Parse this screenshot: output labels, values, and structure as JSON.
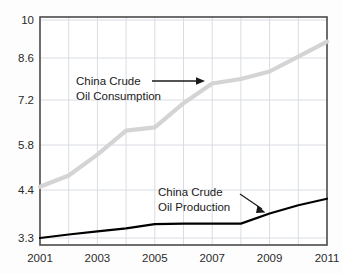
{
  "chart_data": {
    "type": "line",
    "title": "",
    "subtitle": "",
    "xlabel": "",
    "ylabel": "",
    "xlim": [
      2001,
      2011
    ],
    "ylim": [
      3.3,
      10
    ],
    "grid": true,
    "legend_position": "none",
    "x": [
      2001,
      2002,
      2003,
      2004,
      2005,
      2006,
      2007,
      2008,
      2009,
      2010,
      2011
    ],
    "series": [
      {
        "name": "China Crude Oil Consumption",
        "color": "#d4d4d4",
        "values": [
          4.5,
          4.85,
          5.5,
          6.25,
          6.35,
          7.1,
          7.75,
          7.9,
          8.15,
          8.65,
          9.2
        ]
      },
      {
        "name": "China Crude Oil Production",
        "color": "#000000",
        "values": [
          3.3,
          3.38,
          3.45,
          3.52,
          3.62,
          3.63,
          3.63,
          3.63,
          3.86,
          4.05,
          4.2
        ]
      }
    ],
    "y_ticks": [
      {
        "label": "10",
        "value": 10
      },
      {
        "label": "8.6",
        "value": 8.6
      },
      {
        "label": "7.2",
        "value": 7.2
      },
      {
        "label": "5.8",
        "value": 5.8
      },
      {
        "label": "4.4",
        "value": 4.4
      },
      {
        "label": "3.3",
        "value": 3.3
      }
    ],
    "x_ticks": [
      {
        "label": "2001",
        "value": 2001
      },
      {
        "label": "2003",
        "value": 2003
      },
      {
        "label": "2005",
        "value": 2005
      },
      {
        "label": "2007",
        "value": 2007
      },
      {
        "label": "2009",
        "value": 2009
      },
      {
        "label": "2011",
        "value": 2011
      }
    ],
    "x_gridlines": [
      2001,
      2002,
      2003,
      2004,
      2005,
      2006,
      2007,
      2008,
      2009,
      2010,
      2011
    ],
    "annotations": [
      {
        "id": "consumption",
        "line1": "China Crude",
        "line2": "Oil Consumption",
        "arrow": "right"
      },
      {
        "id": "production",
        "line1": "China Crude",
        "line2": "Oil Production",
        "arrow": "down-right"
      }
    ]
  },
  "colors": {
    "consumption_line": "#d4d4d4",
    "production_line": "#000000",
    "gridline": "#d8dce3",
    "axis_frame": "#4a4a4a",
    "tick_label": "#2b2b2b",
    "annotation_text": "#1a1a1a",
    "background": "#fdfdfd"
  }
}
